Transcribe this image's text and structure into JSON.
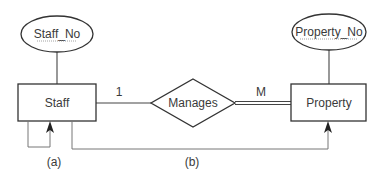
{
  "diagram": {
    "type": "ER diagram",
    "entities": [
      {
        "id": "staff",
        "label": "Staff"
      },
      {
        "id": "property",
        "label": "Property"
      }
    ],
    "attributes": [
      {
        "id": "staff_no",
        "label": "Staff_No",
        "entity": "staff",
        "key": true
      },
      {
        "id": "property_no",
        "label": "Property_No",
        "entity": "property",
        "key": true
      }
    ],
    "relationships": [
      {
        "id": "manages",
        "label": "Manages",
        "from": "staff",
        "to": "property",
        "from_cardinality": "1",
        "to_cardinality": "M"
      }
    ],
    "annotations": {
      "a": "(a)",
      "b": "(b)"
    }
  }
}
